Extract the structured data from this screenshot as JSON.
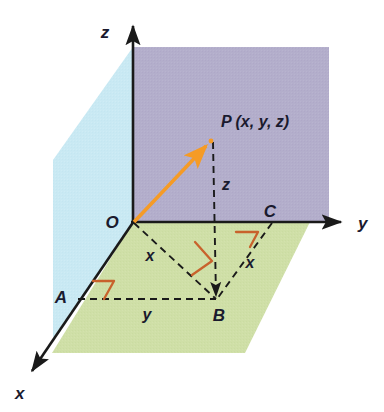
{
  "figure": {
    "axes": [
      {
        "name": "z-axis",
        "label": "z",
        "label_x": 105,
        "label_y": 38
      },
      {
        "name": "y-axis",
        "label": "y",
        "label_x": 358,
        "label_y": 229
      },
      {
        "name": "x-axis",
        "label": "x",
        "label_x": 15,
        "label_y": 399
      }
    ],
    "points": [
      {
        "name": "origin",
        "label": "O",
        "label_x": 112,
        "label_y": 228,
        "px": 133,
        "py": 222
      },
      {
        "name": "point-p",
        "label": "P (x, y, z)",
        "label_x": 221,
        "label_y": 127,
        "px": 211,
        "py": 140
      },
      {
        "name": "point-a",
        "label": "A",
        "label_x": 61,
        "label_y": 303,
        "px": 77,
        "py": 298
      },
      {
        "name": "point-b",
        "label": "B",
        "label_x": 215,
        "label_y": 320,
        "px": 217,
        "py": 300
      },
      {
        "name": "point-c",
        "label": "C",
        "label_x": 266,
        "label_y": 217,
        "px": 272,
        "py": 222
      }
    ],
    "segment_labels": [
      {
        "name": "segment-label-z",
        "label": "z",
        "label_x": 222,
        "label_y": 188
      },
      {
        "name": "segment-label-x-left",
        "label": "x",
        "label_x": 144,
        "label_y": 261
      },
      {
        "name": "segment-label-x-right",
        "label": "x",
        "label_x": 248,
        "label_y": 268
      },
      {
        "name": "segment-label-y-bottom",
        "label": "y",
        "label_x": 141,
        "label_y": 320
      }
    ],
    "colors": {
      "plane_yz": "#b3aecb",
      "plane_xz": "#c9e9f3",
      "plane_xy": "#cfdfa7",
      "vector": "#f59b26",
      "right_angle": "#c8622c",
      "axis": "#1a1a1a",
      "dashed": "#1a1a1a",
      "background": "#ffffff"
    },
    "geometry": {
      "origin": [
        133,
        222
      ],
      "z_axis_tip": [
        133,
        22
      ],
      "y_axis_tip": [
        345,
        222
      ],
      "x_axis_tip": [
        28,
        375
      ],
      "point_p": [
        211,
        140
      ],
      "point_a": [
        77,
        298
      ],
      "point_b": [
        217,
        300
      ],
      "point_c": [
        272,
        222
      ],
      "plane_yz_rect": [
        133,
        47,
        329,
        222
      ],
      "plane_xz_poly": "133,47 133,222 53,338 53,160",
      "plane_xy_poly": "133,222 310,222 245,353 52,353"
    },
    "elements": [
      {
        "name": "vector-op",
        "from": "O",
        "to": "P",
        "style": "solid-arrow-orange"
      },
      {
        "name": "dashed-pb",
        "from": "P",
        "to": "B",
        "style": "dashed"
      },
      {
        "name": "dashed-ob",
        "from": "O",
        "to": "B",
        "style": "dashed"
      },
      {
        "name": "dashed-ab",
        "from": "A",
        "to": "B",
        "style": "dashed"
      },
      {
        "name": "dashed-cb",
        "from": "C",
        "to": "B",
        "style": "dashed"
      }
    ]
  }
}
